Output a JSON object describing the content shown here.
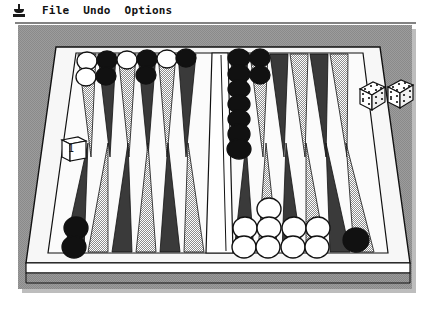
{
  "window": {
    "title": "Backgammon",
    "width": 423,
    "height": 310
  },
  "menubar": {
    "apple_icon": "goblet-icon",
    "items": [
      {
        "label": "File",
        "name": "menu-file"
      },
      {
        "label": "Undo",
        "name": "menu-undo"
      },
      {
        "label": "Options",
        "name": "menu-options"
      }
    ]
  },
  "board": {
    "description": "3D perspective backgammon board viewed from the near side",
    "colors": {
      "backdrop": "#8f8f8f",
      "board_surface": "#f2f2f2",
      "frame": "#ffffff",
      "point_dark": "#3a3a3a",
      "point_light": "#a8a8a8",
      "checker_dark": "#111111",
      "checker_light": "#ffffff",
      "outline": "#111111",
      "window_background": "#ffffff",
      "shadow": "#bdbdbd"
    },
    "point_count": 24,
    "bar_label": "center-bar"
  },
  "dice": {
    "label": "dice-pair",
    "count": 2,
    "values": [
      5,
      5
    ],
    "position": "right tray"
  },
  "doubling_cube": {
    "label": "doubling-cube",
    "value": "1",
    "position": "left tray"
  },
  "checkers": {
    "dark_label": "dark-checker",
    "light_label": "light-checker",
    "top_left_quadrant": [
      {
        "point": 1,
        "color": "light",
        "count": 2
      },
      {
        "point": 2,
        "color": "dark",
        "count": 2
      },
      {
        "point": 3,
        "color": "light",
        "count": 1
      },
      {
        "point": 4,
        "color": "dark",
        "count": 2
      },
      {
        "point": 5,
        "color": "light",
        "count": 1
      }
    ],
    "top_right_quadrant": [
      {
        "point": 7,
        "color": "dark",
        "count": 7
      },
      {
        "point": 8,
        "color": "dark",
        "count": 2
      }
    ],
    "bottom_left_quadrant": [
      {
        "point": 19,
        "color": "dark",
        "count": 2
      }
    ],
    "bottom_right_quadrant": [
      {
        "point": 20,
        "color": "light",
        "count": 2
      },
      {
        "point": 21,
        "color": "light",
        "count": 3
      },
      {
        "point": 22,
        "color": "light",
        "count": 2
      },
      {
        "point": 23,
        "color": "light",
        "count": 2
      },
      {
        "point": 24,
        "color": "dark",
        "count": 1
      }
    ]
  }
}
